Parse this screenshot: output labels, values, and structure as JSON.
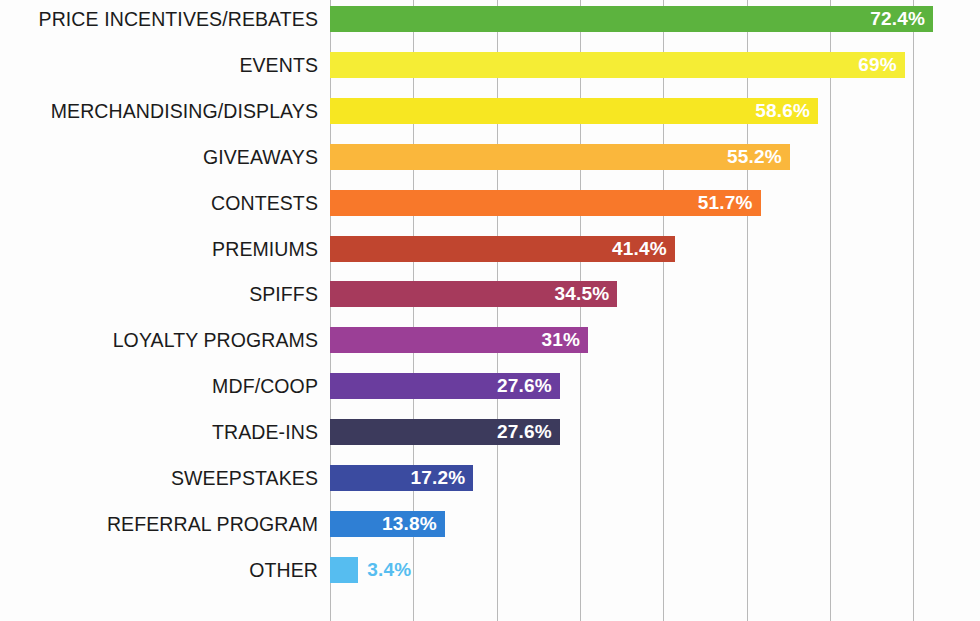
{
  "chart_data": {
    "type": "bar",
    "orientation": "horizontal",
    "title": "",
    "subtitle": "",
    "xlabel": "",
    "ylabel": "",
    "xlim": [
      0,
      78
    ],
    "gridlines_at": [
      0,
      10,
      20,
      30,
      40,
      50,
      60,
      70
    ],
    "grid": true,
    "legend": "none",
    "value_suffix": "%",
    "categories": [
      "PRICE INCENTIVES/REBATES",
      "EVENTS",
      "MERCHANDISING/DISPLAYS",
      "GIVEAWAYS",
      "CONTESTS",
      "PREMIUMS",
      "SPIFFS",
      "LOYALTY PROGRAMS",
      "MDF/COOP",
      "TRADE-INS",
      "SWEEPSTAKES",
      "REFERRAL PROGRAM",
      "OTHER"
    ],
    "values": [
      72.4,
      69,
      58.6,
      55.2,
      51.7,
      41.4,
      34.5,
      31,
      27.6,
      27.6,
      17.2,
      13.8,
      3.4
    ],
    "value_labels": [
      "72.4%",
      "69%",
      "58.6%",
      "55.2%",
      "51.7%",
      "41.4%",
      "34.5%",
      "31%",
      "27.6%",
      "27.6%",
      "17.2%",
      "13.8%",
      "3.4%"
    ],
    "colors": [
      "#5cb33e",
      "#f5ed35",
      "#f7e722",
      "#fab73c",
      "#f8782a",
      "#c0452f",
      "#a63a5c",
      "#9b3f96",
      "#6a3d9e",
      "#3c3a5c",
      "#3b4ba0",
      "#2f7fd4",
      "#56bdf0"
    ],
    "label_placement": [
      "inside",
      "inside",
      "inside",
      "inside",
      "inside",
      "inside",
      "inside",
      "inside",
      "inside",
      "inside",
      "inside",
      "inside",
      "outside"
    ],
    "grid_color": "#b9b9b9",
    "background_color": "#fdfdfd",
    "category_label_color": "#1b1b1b",
    "inside_label_color": "#ffffff"
  }
}
